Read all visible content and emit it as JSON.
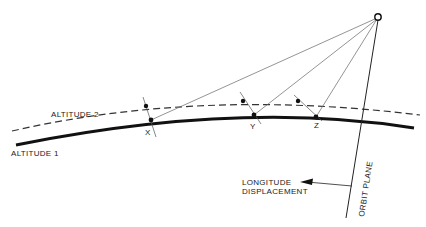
{
  "diagram": {
    "labels": {
      "altitude1": "ALTITUDE 1",
      "altitude2": "ALTITUDE 2",
      "point_x": "X",
      "point_y": "Y",
      "point_z": "Z",
      "longitude_line1": "LONGITUDE",
      "longitude_line2": "DISPLACEMENT",
      "orbit_plane": "ORBIT PLANE"
    },
    "colors": {
      "ink": "#1a1a1a",
      "thin_line": "#555555",
      "background": "#ffffff"
    },
    "satellite": {
      "x": 378,
      "y": 17,
      "r": 3.2
    },
    "points_altitude1": [
      {
        "name": "X",
        "x": 151,
        "y": 120
      },
      {
        "name": "Y",
        "x": 254,
        "y": 115
      },
      {
        "name": "Z",
        "x": 316,
        "y": 117
      }
    ],
    "points_altitude2": [
      {
        "x": 146,
        "y": 106
      },
      {
        "x": 243,
        "y": 101
      },
      {
        "x": 298,
        "y": 101
      }
    ]
  }
}
